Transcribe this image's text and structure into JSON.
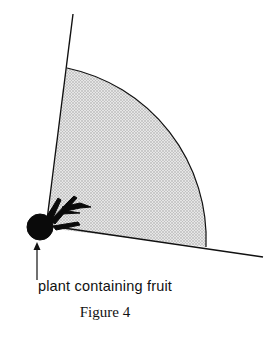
{
  "figure": {
    "label": "plant containing fruit",
    "caption": "Figure 4"
  },
  "colors": {
    "ink": "#111111",
    "fill": "#d9d9d9"
  }
}
